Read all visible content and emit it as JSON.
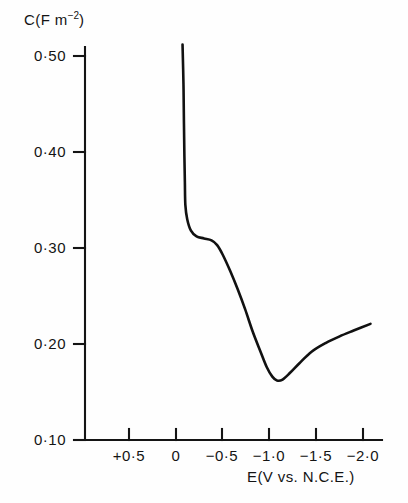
{
  "figure": {
    "background_color": "#fefefe",
    "ink_color": "#111111"
  },
  "chart_data": {
    "type": "line",
    "title": "",
    "subtitle": "",
    "xlabel": "E(V vs. N.C.E.)",
    "ylabel": "C(F m−2)",
    "ylabel_base": "C(F m",
    "ylabel_exponent": "−2",
    "ylabel_close": ")",
    "grid": false,
    "legend": "none",
    "xlim": [
      0.75,
      -2.25
    ],
    "ylim": [
      0.1,
      0.52
    ],
    "x_axis_inverted": true,
    "xticks": [
      0.5,
      0.0,
      -0.5,
      -1.0,
      -1.5,
      -2.0
    ],
    "xticklabels": [
      "+0·5",
      "0",
      "−0·5",
      "−1·0",
      "−1·5",
      "−2·0"
    ],
    "yticks": [
      0.5,
      0.4,
      0.3,
      0.2,
      0.1
    ],
    "yticklabels": [
      "0·50",
      "0·40",
      "0·30",
      "0·20",
      "0·10"
    ],
    "series": [
      {
        "name": "differential capacitance",
        "line_color": "#111111",
        "line_width": 2.6,
        "points": [
          {
            "x": -0.07,
            "y": 0.512
          },
          {
            "x": -0.08,
            "y": 0.47
          },
          {
            "x": -0.085,
            "y": 0.43
          },
          {
            "x": -0.09,
            "y": 0.395
          },
          {
            "x": -0.095,
            "y": 0.368
          },
          {
            "x": -0.1,
            "y": 0.345
          },
          {
            "x": -0.12,
            "y": 0.33
          },
          {
            "x": -0.16,
            "y": 0.318
          },
          {
            "x": -0.22,
            "y": 0.312
          },
          {
            "x": -0.3,
            "y": 0.31
          },
          {
            "x": -0.38,
            "y": 0.308
          },
          {
            "x": -0.44,
            "y": 0.303
          },
          {
            "x": -0.5,
            "y": 0.293
          },
          {
            "x": -0.58,
            "y": 0.276
          },
          {
            "x": -0.66,
            "y": 0.257
          },
          {
            "x": -0.74,
            "y": 0.236
          },
          {
            "x": -0.82,
            "y": 0.213
          },
          {
            "x": -0.9,
            "y": 0.193
          },
          {
            "x": -0.97,
            "y": 0.176
          },
          {
            "x": -1.03,
            "y": 0.166
          },
          {
            "x": -1.08,
            "y": 0.162
          },
          {
            "x": -1.14,
            "y": 0.163
          },
          {
            "x": -1.22,
            "y": 0.17
          },
          {
            "x": -1.32,
            "y": 0.18
          },
          {
            "x": -1.45,
            "y": 0.192
          },
          {
            "x": -1.6,
            "y": 0.201
          },
          {
            "x": -1.75,
            "y": 0.208
          },
          {
            "x": -1.9,
            "y": 0.214
          },
          {
            "x": -2.08,
            "y": 0.221
          }
        ]
      }
    ],
    "annotations": {
      "minimum_x": -1.08,
      "minimum_y": 0.162,
      "plateau_x": -0.3,
      "plateau_y": 0.31
    }
  }
}
